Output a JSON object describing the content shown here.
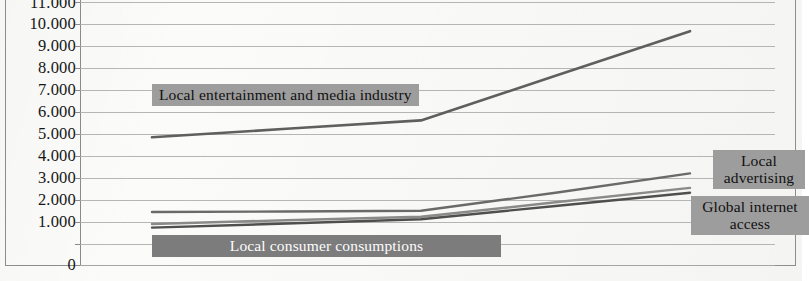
{
  "chart_data": {
    "type": "line",
    "title": "",
    "subtitle": "",
    "xlabel": "",
    "ylabel": "",
    "ylim": [
      0,
      11000
    ],
    "ytick_labels": [
      "11.000",
      "10.000",
      "9.000",
      "8.000",
      "7.000",
      "6.000",
      "5.000",
      "4.000",
      "3.000",
      "2.000",
      "1.000",
      "0"
    ],
    "ytick_values": [
      11000,
      10000,
      9000,
      8000,
      7000,
      6000,
      5000,
      4000,
      3000,
      2000,
      1000,
      0
    ],
    "grid": true,
    "grid_axis": "y",
    "legend": "inline-annotations",
    "x": [
      0,
      1,
      2,
      3,
      4
    ],
    "series": [
      {
        "name": "Local entertainment and media industry",
        "values": [
          5300,
          5650,
          6000,
          7850,
          9700
        ],
        "color": "#5f5f5f"
      },
      {
        "name": "Local advertising",
        "values": [
          2200,
          2220,
          2250,
          3000,
          3800
        ],
        "color": "#6a6a6a"
      },
      {
        "name": "Global internet access upper",
        "values": [
          1700,
          1860,
          2000,
          2600,
          3200
        ],
        "color": "#8a8a8a"
      },
      {
        "name": "Global internet access lower",
        "values": [
          1550,
          1720,
          1900,
          2450,
          3000
        ],
        "color": "#4f4f4f"
      }
    ],
    "annotations": [
      {
        "id": "entertainment",
        "text": "Local entertainment and media industry",
        "style": "light"
      },
      {
        "id": "advertising",
        "text": "Local advertising",
        "style": "light"
      },
      {
        "id": "internet",
        "text": "Global internet access",
        "style": "light"
      },
      {
        "id": "consumption",
        "text": "Local consumer consumptions",
        "style": "dark"
      }
    ]
  },
  "yaxis": {
    "labels": [
      {
        "text": "11.000"
      },
      {
        "text": "10.000"
      },
      {
        "text": "9.000"
      },
      {
        "text": "8.000"
      },
      {
        "text": "7.000"
      },
      {
        "text": "6.000"
      },
      {
        "text": "5.000"
      },
      {
        "text": "4.000"
      },
      {
        "text": "3.000"
      },
      {
        "text": "2.000"
      },
      {
        "text": "1.000"
      },
      {
        "text": "0"
      }
    ]
  },
  "callouts": {
    "entertainment": "Local entertainment and media industry",
    "advertising": "Local advertising",
    "internet": "Global internet access",
    "consumption": "Local consumer consumptions"
  },
  "colors": {
    "grid": "#a9a9a9",
    "axis": "#8a8a8a",
    "frame": "#8d8d8d",
    "callout_light_bg": "#9d9d9d",
    "callout_dark_bg": "#7c7c7c",
    "paper": "#fbfbf9"
  }
}
